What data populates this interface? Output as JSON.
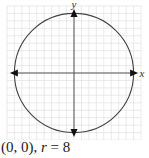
{
  "chart_data": {
    "type": "line",
    "title": "",
    "xlabel": "x",
    "ylabel": "y",
    "xlim": [
      -9,
      9
    ],
    "ylim": [
      -9,
      9
    ],
    "grid": true,
    "grid_step": 1,
    "series": [
      {
        "name": "circle",
        "shape": "circle",
        "center": [
          0,
          0
        ],
        "radius": 8
      }
    ],
    "caption": {
      "center": "(0, 0),",
      "r_var": "r",
      "r_eq": " = 8"
    }
  },
  "colors": {
    "grid": "#dcdcdc",
    "axis": "#555555",
    "circle": "#444444",
    "arrow": "#111111"
  }
}
